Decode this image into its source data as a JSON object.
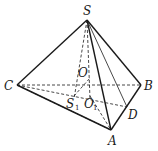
{
  "figure": {
    "type": "triangular pyramid (tetrahedron)",
    "points": {
      "S": {
        "label": "S",
        "x": 87,
        "y": 20
      },
      "A": {
        "label": "A",
        "x": 111,
        "y": 130
      },
      "B": {
        "label": "B",
        "x": 141,
        "y": 85
      },
      "C": {
        "label": "C",
        "x": 17,
        "y": 85
      },
      "D": {
        "label": "D",
        "x": 127,
        "y": 107
      },
      "O": {
        "label": "O",
        "x": 89,
        "y": 78
      },
      "S1": {
        "label": "S",
        "sub": "1",
        "x": 74,
        "y": 99
      },
      "O1": {
        "label": "O",
        "sub": "1",
        "x": 90,
        "y": 99
      }
    },
    "edges_solid": [
      "SC",
      "SB",
      "SA",
      "CA",
      "AB"
    ],
    "edges_thin": [
      "SD"
    ],
    "edges_dashed": [
      "CB",
      "CD",
      "SS1",
      "SO1",
      "OO1",
      "S1A",
      "OD"
    ]
  }
}
